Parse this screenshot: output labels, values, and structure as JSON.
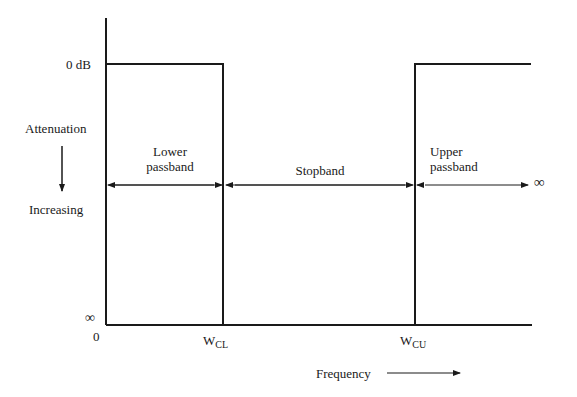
{
  "diagram": {
    "type": "band-stop filter attenuation response",
    "y_axis": {
      "top_label": "0 dB",
      "bottom_label": "∞",
      "title_top": "Attenuation",
      "title_bottom": "Increasing",
      "direction": "down"
    },
    "x_axis": {
      "origin_label": "0",
      "title": "Frequency",
      "ticks": [
        {
          "main": "W",
          "sub": "CL"
        },
        {
          "main": "W",
          "sub": "CU"
        }
      ]
    },
    "regions": [
      {
        "line1": "Lower",
        "line2": "passband"
      },
      {
        "line1": "Stopband",
        "line2": ""
      },
      {
        "line1": "Upper",
        "line2": "passband"
      }
    ],
    "infinity_label": "∞",
    "colors": {
      "line": "#1a1a1a",
      "background": "#ffffff"
    }
  }
}
